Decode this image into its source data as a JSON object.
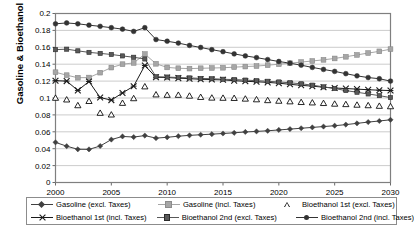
{
  "chart_data": {
    "type": "line",
    "title": "",
    "xlabel": "",
    "ylabel": "Gasoline & Bioethanol (€/kWh)",
    "xlim": [
      2000,
      2030
    ],
    "ylim": [
      0,
      0.2
    ],
    "grid": true,
    "legend_position": "bottom",
    "ytick_labels": [
      "0.2",
      "0.18",
      "0.16",
      "0.14",
      "0.12",
      "0.1",
      "0.08",
      "0.06",
      "0.04",
      "0.02",
      "0"
    ],
    "ytick_values": [
      0.2,
      0.18,
      0.16,
      0.14,
      0.12,
      0.1,
      0.08,
      0.06,
      0.04,
      0.02,
      0
    ],
    "xtick_labels": [
      "2000",
      "2005",
      "2010",
      "2015",
      "2020",
      "2025",
      "2030"
    ],
    "xtick_values": [
      2000,
      2005,
      2010,
      2015,
      2020,
      2025,
      2030
    ],
    "x": [
      2000,
      2001,
      2002,
      2003,
      2004,
      2005,
      2006,
      2007,
      2008,
      2009,
      2010,
      2011,
      2012,
      2013,
      2014,
      2015,
      2016,
      2017,
      2018,
      2019,
      2020,
      2021,
      2022,
      2023,
      2024,
      2025,
      2026,
      2027,
      2028,
      2029,
      2030
    ],
    "series": [
      {
        "name": "Gasoline (excl. Taxes)",
        "marker": "diamond",
        "color": "#404040",
        "values": [
          0.0475,
          0.043,
          0.0393,
          0.0392,
          0.0432,
          0.0508,
          0.0545,
          0.0538,
          0.0555,
          0.0525,
          0.0535,
          0.0548,
          0.0558,
          0.0565,
          0.0572,
          0.058,
          0.0588,
          0.0598,
          0.0605,
          0.0612,
          0.0622,
          0.0632,
          0.0642,
          0.0652,
          0.0662,
          0.0672,
          0.0685,
          0.07,
          0.0715,
          0.0728,
          0.0742
        ]
      },
      {
        "name": "Gasoline (incl. Taxes)",
        "marker": "square",
        "color": "#a6a6a6",
        "values": [
          0.1305,
          0.127,
          0.124,
          0.1242,
          0.13,
          0.136,
          0.14,
          0.1415,
          0.152,
          0.1405,
          0.1362,
          0.1352,
          0.1348,
          0.1352,
          0.1355,
          0.1358,
          0.1365,
          0.1372,
          0.1378,
          0.1388,
          0.14,
          0.1412,
          0.1425,
          0.1438,
          0.1452,
          0.1468,
          0.1488,
          0.151,
          0.1532,
          0.1552,
          0.1578
        ]
      },
      {
        "name": "Bioethanol 1st (excl. Taxes)",
        "marker": "triangle-open",
        "color": "#000000",
        "values": [
          0.1,
          0.098,
          0.0912,
          0.0962,
          0.0822,
          0.0802,
          0.094,
          0.0995,
          0.1135,
          0.104,
          0.1035,
          0.1035,
          0.1025,
          0.101,
          0.1002,
          0.1,
          0.0998,
          0.099,
          0.0982,
          0.0972,
          0.0965,
          0.0958,
          0.095,
          0.0945,
          0.0938,
          0.093,
          0.0925,
          0.0918,
          0.0912,
          0.0905,
          0.09
        ]
      },
      {
        "name": "Bioethanol 1st (incl. Taxes)",
        "marker": "star-x",
        "color": "#1a1a1a",
        "values": [
          0.1205,
          0.12,
          0.109,
          0.1195,
          0.1005,
          0.0975,
          0.106,
          0.114,
          0.1385,
          0.1245,
          0.1242,
          0.1235,
          0.1228,
          0.1222,
          0.1218,
          0.1215,
          0.1205,
          0.1198,
          0.1192,
          0.1185,
          0.1175,
          0.1162,
          0.115,
          0.114,
          0.1128,
          0.1118,
          0.1112,
          0.1105,
          0.1098,
          0.1092,
          0.1088
        ]
      },
      {
        "name": "Bioethanol 2nd (excl. Taxes)",
        "marker": "square-small",
        "color": "#595959",
        "values": [
          0.1572,
          0.1578,
          0.1558,
          0.154,
          0.1528,
          0.1515,
          0.1498,
          0.1482,
          0.1462,
          0.1252,
          0.1248,
          0.1242,
          0.1238,
          0.1232,
          0.1228,
          0.1222,
          0.1218,
          0.1212,
          0.1205,
          0.1198,
          0.119,
          0.118,
          0.1168,
          0.1152,
          0.1132,
          0.1112,
          0.1088,
          0.1068,
          0.1048,
          0.1028,
          0.1005
        ]
      },
      {
        "name": "Bioethanol 2nd (incl. Taxes)",
        "marker": "circle",
        "color": "#333333",
        "values": [
          0.1878,
          0.1888,
          0.1878,
          0.1862,
          0.1848,
          0.1832,
          0.1815,
          0.1788,
          0.1832,
          0.1692,
          0.1672,
          0.165,
          0.1622,
          0.1598,
          0.1572,
          0.1548,
          0.1522,
          0.1498,
          0.1478,
          0.1455,
          0.1432,
          0.1412,
          0.1388,
          0.1362,
          0.1338,
          0.1315,
          0.1288,
          0.1262,
          0.1242,
          0.1228,
          0.12
        ]
      }
    ]
  },
  "legend": {
    "items": [
      {
        "label": "Gasoline (excl. Taxes)",
        "marker": "diamond",
        "color": "#404040"
      },
      {
        "label": "Gasoline (incl. Taxes)",
        "marker": "square",
        "color": "#a6a6a6"
      },
      {
        "label": "Bioethanol 1st (excl. Taxes)",
        "marker": "triangle-open",
        "color": "#000000"
      },
      {
        "label": "Bioethanol 1st (incl. Taxes)",
        "marker": "star-x",
        "color": "#1a1a1a"
      },
      {
        "label": "Bioethanol 2nd (excl. Taxes)",
        "marker": "square-small",
        "color": "#595959"
      },
      {
        "label": "Bioethanol 2nd (incl. Taxes)",
        "marker": "circle",
        "color": "#333333"
      }
    ]
  },
  "colors": {
    "plot_border": "#7f7f7f",
    "gridline": "#bfbfbf",
    "axis": "#595959",
    "background": "#ffffff"
  }
}
